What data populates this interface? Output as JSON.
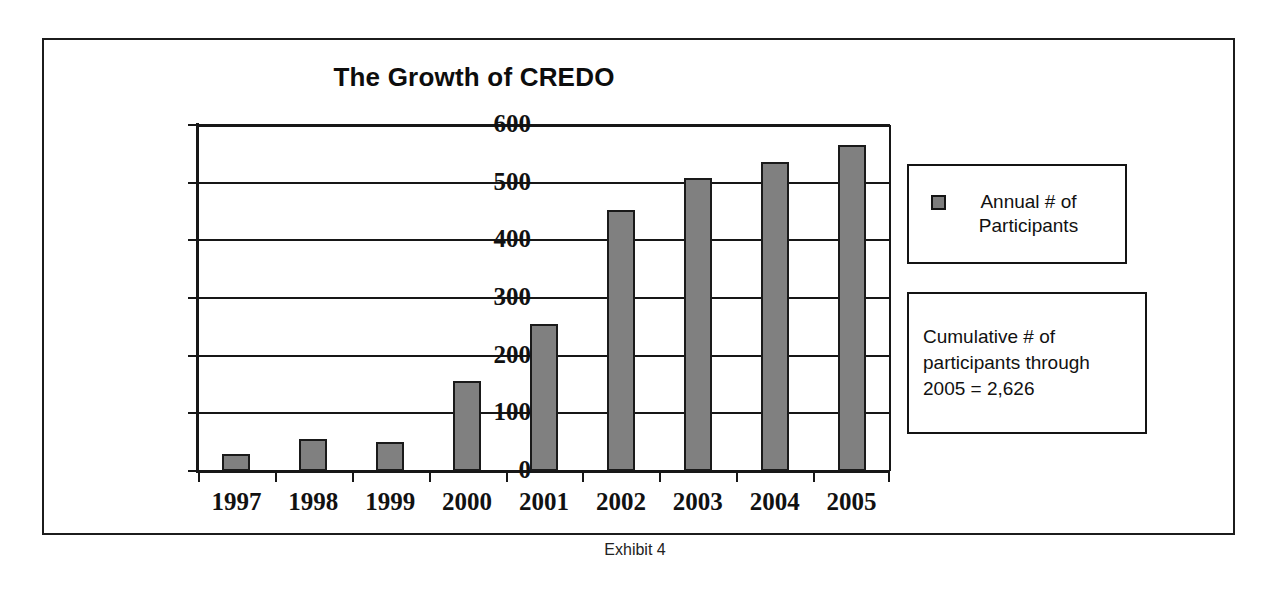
{
  "caption": "Exhibit 4",
  "legend": {
    "swatch_color": "#7d7d7d",
    "label": "Annual # of Participants"
  },
  "annotation": {
    "text": "Cumulative # of participants through 2005 = 2,626"
  },
  "chart_data": {
    "type": "bar",
    "title": "The Growth of CREDO",
    "xlabel": "",
    "ylabel": "",
    "categories": [
      "1997",
      "1998",
      "1999",
      "2000",
      "2001",
      "2002",
      "2003",
      "2004",
      "2005"
    ],
    "values": [
      30,
      55,
      50,
      156,
      255,
      452,
      508,
      535,
      565
    ],
    "series": [
      {
        "name": "Annual # of Participants",
        "values": [
          30,
          55,
          50,
          156,
          255,
          452,
          508,
          535,
          565
        ],
        "color": "#808080"
      }
    ],
    "ylim": [
      0,
      600
    ],
    "ytick_values": [
      0,
      100,
      200,
      300,
      400,
      500,
      600
    ],
    "ytick_labels": [
      "0",
      "100",
      "200",
      "300",
      "400",
      "500",
      "600"
    ],
    "grid": true,
    "grid_axis": "y",
    "legend_position": "right",
    "annotations": [
      "Cumulative # of participants through 2005 = 2,626"
    ]
  }
}
